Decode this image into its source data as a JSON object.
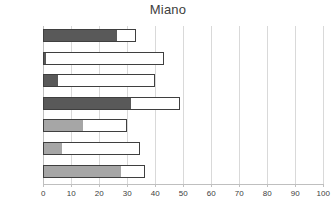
{
  "chart_data": {
    "type": "bar",
    "orientation": "horizontal",
    "stacked": true,
    "title": "Miano",
    "xlabel": "",
    "ylabel": "",
    "xlim": [
      0,
      100
    ],
    "xticks": [
      0,
      10,
      20,
      30,
      40,
      50,
      60,
      70,
      80,
      90,
      100
    ],
    "grid": true,
    "legend": "none",
    "categories": [
      "Goal 3",
      "Goal 4",
      "Goal 8",
      "Goal 10",
      "Goal 11",
      "Goal 12",
      "Goal 13"
    ],
    "series": [
      {
        "name": "filled",
        "color": "#595959",
        "values": [
          26,
          0.5,
          5,
          31,
          14,
          6.5,
          27.5
        ]
      },
      {
        "name": "remainder",
        "color": "#ffffff",
        "values": [
          7,
          42.5,
          35,
          18,
          16,
          28,
          9
        ]
      }
    ],
    "totals": [
      33,
      43,
      40,
      49,
      30,
      34.5,
      36.5
    ],
    "bar_fill_colors": [
      "#595959",
      "#595959",
      "#595959",
      "#595959",
      "#a6a6a6",
      "#a6a6a6",
      "#a6a6a6"
    ],
    "bar_border_color": "#3f3f3f",
    "gridline_color": "#d9d9d9",
    "axis_color": "#bfbfbf",
    "text_color": "#404040",
    "background": "#ffffff"
  }
}
